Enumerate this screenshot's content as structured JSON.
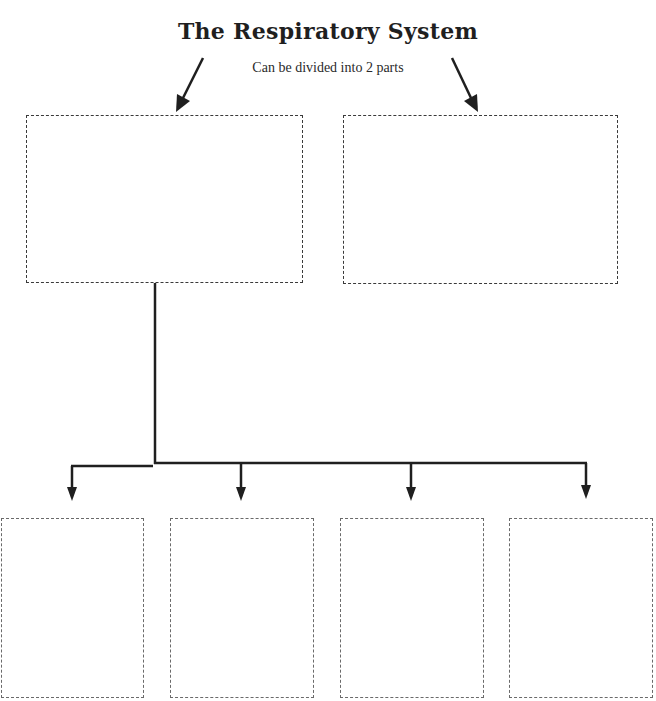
{
  "diagram": {
    "title": "The Respiratory System",
    "subtitle": "Can be divided into 2 parts",
    "top_boxes": [
      {
        "id": "part-1",
        "text": ""
      },
      {
        "id": "part-2",
        "text": ""
      }
    ],
    "bottom_boxes": [
      {
        "id": "sub-1",
        "text": ""
      },
      {
        "id": "sub-2",
        "text": ""
      },
      {
        "id": "sub-3",
        "text": ""
      },
      {
        "id": "sub-4",
        "text": ""
      }
    ],
    "colors": {
      "line": "#1f1f1f",
      "dash_large": "#3a3a3a",
      "dash_small": "#6a6a6a",
      "background": "#ffffff"
    }
  }
}
